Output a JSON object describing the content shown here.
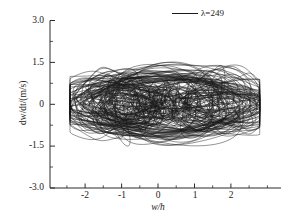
{
  "chart_data": {
    "type": "line",
    "title": "",
    "subtitle": "",
    "xlabel": "w/h",
    "ylabel": "dw/dt/(m/s)",
    "xlim": [
      -2.6,
      2.6
    ],
    "ylim": [
      -3.0,
      3.0
    ],
    "xticks": [
      -2,
      -1,
      0,
      1,
      2
    ],
    "xticklabels": [
      "-2",
      "-1",
      "0",
      "1",
      "2"
    ],
    "yticks": [
      -3.0,
      -1.5,
      0,
      1.5,
      3.0
    ],
    "yticklabels": [
      "-3.0",
      "-1.5",
      "0",
      "1.5",
      "3.0"
    ],
    "minor_ticks": true,
    "grid": false,
    "legend_position": "top-right",
    "series": [
      {
        "name": "λ=249",
        "color": "#1a1a1a",
        "line_width": 0.55,
        "description": "Chaotic phase-portrait attractor: dense twin-lobed trajectory",
        "data_extent": {
          "x_min": -2.15,
          "x_max": 2.12,
          "y_min": -2.02,
          "y_max": 1.72
        },
        "lobe_centers": [
          [
            -1.15,
            0.0
          ],
          [
            1.15,
            0.0
          ]
        ],
        "loop_count": 140
      }
    ]
  },
  "legend": {
    "entries": [
      {
        "label_prefix": "λ",
        "label_value": "=249",
        "full_label": "λ=249"
      }
    ]
  },
  "axes": {
    "x_title": "w/h",
    "x_title_numerator": "w",
    "x_title_separator": "/",
    "x_title_denominator": "h",
    "y_title": "dw/dt/(m/s)",
    "y_title_parts": [
      "d",
      "w",
      "/d",
      "t",
      "/(m/s)"
    ]
  }
}
